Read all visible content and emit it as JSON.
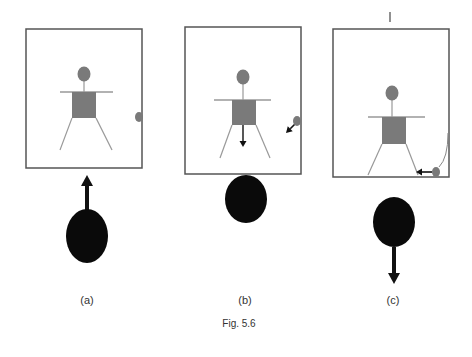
{
  "figure": {
    "caption": "Fig. 5.6",
    "panels": [
      {
        "id": "a",
        "label": "(a)",
        "box": {
          "x": 26,
          "y": 29,
          "w": 116,
          "h": 139
        },
        "person": {
          "head": [
            84,
            74
          ],
          "arms_y": 92,
          "arms_x": [
            60,
            113
          ],
          "body": {
            "x": 72,
            "y": 92,
            "w": 24,
            "h": 26
          },
          "legs": [
            [
              72,
              118,
              60,
              150
            ],
            [
              96,
              118,
              112,
              150
            ]
          ],
          "arrow": null
        },
        "small_ball": {
          "cx": 139,
          "cy": 117,
          "rx": 4,
          "ry": 5,
          "arrow": null,
          "arc": null
        },
        "big_ball": {
          "cx": 87,
          "cy": 236,
          "rx": 21,
          "ry": 27,
          "arrow": {
            "direction": "up",
            "from": 210,
            "to": 175
          }
        },
        "label_pos": [
          87,
          294
        ],
        "tick": null
      },
      {
        "id": "b",
        "label": "(b)",
        "box": {
          "x": 185,
          "y": 27,
          "w": 116,
          "h": 147
        },
        "person": {
          "head": [
            243,
            77
          ],
          "arms_y": 100,
          "arms_x": [
            214,
            271
          ],
          "body": {
            "x": 232,
            "y": 100,
            "w": 24,
            "h": 25
          },
          "legs": [
            [
              232,
              125,
              220,
              158
            ],
            [
              256,
              125,
              270,
              158
            ]
          ],
          "arrow": {
            "x": 243,
            "from": 125,
            "to": 147
          }
        },
        "small_ball": {
          "cx": 297,
          "cy": 121,
          "rx": 4,
          "ry": 5,
          "arrow": {
            "x1": 295,
            "y1": 124,
            "x2": 286,
            "y2": 133
          },
          "arc": null
        },
        "big_ball": {
          "cx": 246,
          "cy": 199,
          "rx": 21,
          "ry": 24,
          "arrow": null
        },
        "label_pos": [
          245,
          294
        ],
        "tick": null
      },
      {
        "id": "c",
        "label": "(c)",
        "box": {
          "x": 333,
          "y": 29,
          "w": 116,
          "h": 148
        },
        "person": {
          "head": [
            392,
            93
          ],
          "arms_y": 117,
          "arms_x": [
            368,
            425
          ],
          "body": {
            "x": 382,
            "y": 117,
            "w": 24,
            "h": 27
          },
          "legs": [
            [
              382,
              144,
              368,
              175
            ],
            [
              406,
              144,
              418,
              175
            ]
          ],
          "arrow": null
        },
        "small_ball": {
          "cx": 436,
          "cy": 172,
          "rx": 4,
          "ry": 5,
          "arrow": {
            "x1": 432,
            "y1": 172,
            "x2": 416,
            "y2": 172
          },
          "arc": "M 448 133 Q 448 158 439 167"
        },
        "big_ball": {
          "cx": 394,
          "cy": 222,
          "rx": 21,
          "ry": 25,
          "arrow": {
            "direction": "down",
            "from": 247,
            "to": 284
          }
        },
        "label_pos": [
          393,
          294
        ],
        "tick": {
          "x": 390,
          "y1": 12,
          "y2": 22
        }
      }
    ],
    "caption_pos": [
      239,
      318
    ],
    "colors": {
      "box_stroke": "#555555",
      "person_fill": "#7a7a7a",
      "limb_stroke": "#999999",
      "big_ball": "#0a0a0a",
      "arrow": "#111111"
    }
  }
}
